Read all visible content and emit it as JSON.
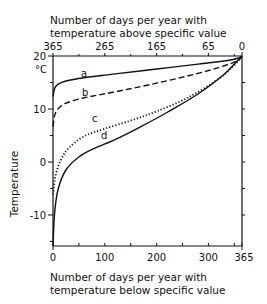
{
  "chart_data": {
    "type": "line",
    "title": "",
    "top_xlabel_line1": "Number of days per year with",
    "top_xlabel_line2": "temperature above specific value",
    "xlabel_line1": "Number of days per year with",
    "xlabel_line2": "temperature below specific value",
    "ylabel": "Temperature",
    "y_unit": "°C",
    "xlim": [
      0,
      365
    ],
    "ylim": [
      -15,
      20
    ],
    "x_ticks": [
      "0",
      "100",
      "200",
      "300",
      "365"
    ],
    "top_x_ticks": [
      "365",
      "265",
      "165",
      "65",
      "0"
    ],
    "y_ticks": [
      "20",
      "10",
      "0",
      "-10"
    ],
    "grid": false,
    "legend": "inline curve labels a, b, c, d",
    "series": [
      {
        "name": "a",
        "style": "solid",
        "x": [
          0,
          3,
          10,
          25,
          60,
          120,
          200,
          280,
          340,
          360,
          365
        ],
        "y": [
          12.5,
          14.0,
          14.8,
          15.4,
          16.0,
          16.7,
          17.6,
          18.5,
          19.2,
          19.7,
          20
        ]
      },
      {
        "name": "b",
        "style": "dashed",
        "x": [
          0,
          3,
          10,
          25,
          60,
          120,
          200,
          280,
          340,
          360,
          365
        ],
        "y": [
          7.0,
          9.0,
          10.3,
          11.3,
          12.3,
          13.4,
          15.0,
          16.8,
          18.5,
          19.4,
          20
        ]
      },
      {
        "name": "c",
        "style": "dotted",
        "x": [
          0,
          5,
          15,
          30,
          60,
          100,
          150,
          200,
          260,
          320,
          350,
          365
        ],
        "y": [
          -5.5,
          -2.0,
          0.8,
          3.0,
          5.2,
          6.6,
          8.1,
          9.8,
          12.3,
          15.8,
          18.3,
          20
        ]
      },
      {
        "name": "d",
        "style": "solid",
        "x": [
          0,
          3,
          10,
          25,
          50,
          80,
          120,
          170,
          220,
          280,
          330,
          355,
          365
        ],
        "y": [
          -15.0,
          -9.0,
          -4.5,
          -1.0,
          1.4,
          3.0,
          4.6,
          7.0,
          9.6,
          13.0,
          16.6,
          19.0,
          20
        ]
      }
    ]
  },
  "labels": {
    "unit": "°C",
    "ylabel": "Temperature",
    "top_line1": "Number of days per year with",
    "top_line2": "temperature above specific value",
    "bottom_line1": "Number of days per year with",
    "bottom_line2": "temperature below specific value",
    "curve_a": "a",
    "curve_b": "b",
    "curve_c": "c",
    "curve_d": "d",
    "yt20": "20",
    "yt10": "10",
    "yt0": "0",
    "ytm10": "-10",
    "xt0": "0",
    "xt100": "100",
    "xt200": "200",
    "xt300": "300",
    "xt365": "365",
    "tt365": "365",
    "tt265": "265",
    "tt165": "165",
    "tt65": "65",
    "tt0": "0"
  }
}
